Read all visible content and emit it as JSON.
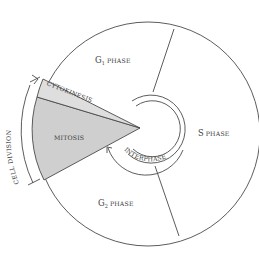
{
  "diagram": {
    "phases": [
      {
        "id": "g1",
        "letter": "G",
        "subscript": "1",
        "label": "phase"
      },
      {
        "id": "s",
        "letter": "S",
        "label": "phase"
      },
      {
        "id": "g2",
        "letter": "G",
        "subscript": "2",
        "label": "phase"
      }
    ],
    "mitosis_label": "MITOSIS",
    "cytokinesis_label": "CYTOKINESIS",
    "interphase_label": "INTERPHASE",
    "cell_division_label": "CELL  DIVISION",
    "colors": {
      "line": "#4a4a4a",
      "mitosis_fill": "#cfcfcf",
      "cytokinesis_fill": "#dedede",
      "background": "#ffffff"
    }
  }
}
